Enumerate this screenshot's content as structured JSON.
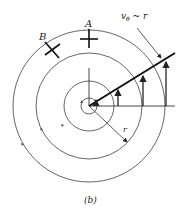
{
  "figure": {
    "caption": "(b)",
    "labels": {
      "point_a": "A",
      "point_b": "B",
      "velocity": "v",
      "velocity_sub": "θ",
      "velocity_rel": " ~ r",
      "radius": "r"
    },
    "colors": {
      "lines": "#333333",
      "circles": "#555555",
      "background": "#ffffff"
    },
    "center": [
      89,
      106
    ],
    "circle_radii": [
      8,
      25,
      53,
      76
    ]
  }
}
